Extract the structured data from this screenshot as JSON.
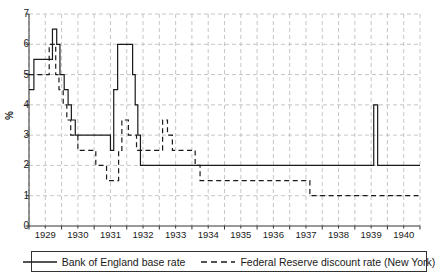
{
  "chart_data": {
    "type": "line",
    "title": "",
    "xlabel": "",
    "ylabel": "%",
    "xlim": [
      1929.0,
      1941.0
    ],
    "ylim": [
      0,
      7
    ],
    "yticks": [
      0,
      1,
      2,
      3,
      4,
      5,
      6,
      7
    ],
    "xticks": [
      1929,
      1930,
      1931,
      1932,
      1933,
      1934,
      1935,
      1936,
      1937,
      1938,
      1939,
      1940
    ],
    "grid": "dashed-both-axes",
    "legend_position": "below-axes",
    "series": [
      {
        "name": "Bank of England base rate",
        "style": "solid",
        "color": "#1a1a1a",
        "points": [
          [
            1929.0,
            4.5
          ],
          [
            1929.15,
            4.5
          ],
          [
            1929.15,
            5.5
          ],
          [
            1929.72,
            5.5
          ],
          [
            1929.72,
            6.5
          ],
          [
            1929.85,
            6.5
          ],
          [
            1929.85,
            6.0
          ],
          [
            1929.95,
            6.0
          ],
          [
            1929.95,
            5.0
          ],
          [
            1930.08,
            5.0
          ],
          [
            1930.08,
            4.5
          ],
          [
            1930.2,
            4.5
          ],
          [
            1930.2,
            4.0
          ],
          [
            1930.3,
            4.0
          ],
          [
            1930.3,
            3.5
          ],
          [
            1930.42,
            3.5
          ],
          [
            1930.42,
            3.0
          ],
          [
            1931.5,
            3.0
          ],
          [
            1931.5,
            2.5
          ],
          [
            1931.6,
            2.5
          ],
          [
            1931.6,
            4.5
          ],
          [
            1931.72,
            4.5
          ],
          [
            1931.72,
            6.0
          ],
          [
            1932.18,
            6.0
          ],
          [
            1932.18,
            5.0
          ],
          [
            1932.26,
            5.0
          ],
          [
            1932.26,
            4.0
          ],
          [
            1932.34,
            4.0
          ],
          [
            1932.34,
            3.0
          ],
          [
            1932.42,
            3.0
          ],
          [
            1932.42,
            2.0
          ],
          [
            1939.58,
            2.0
          ],
          [
            1939.58,
            4.0
          ],
          [
            1939.7,
            4.0
          ],
          [
            1939.7,
            2.0
          ],
          [
            1941.0,
            2.0
          ]
        ]
      },
      {
        "name": "Federal Reserve discount rate (New York)",
        "style": "dashed",
        "color": "#1a1a1a",
        "points": [
          [
            1929.0,
            5.0
          ],
          [
            1929.62,
            5.0
          ],
          [
            1929.62,
            6.0
          ],
          [
            1929.82,
            6.0
          ],
          [
            1929.82,
            5.0
          ],
          [
            1929.92,
            5.0
          ],
          [
            1929.92,
            4.5
          ],
          [
            1930.05,
            4.5
          ],
          [
            1930.05,
            4.0
          ],
          [
            1930.16,
            4.0
          ],
          [
            1930.16,
            3.5
          ],
          [
            1930.28,
            3.5
          ],
          [
            1930.28,
            3.0
          ],
          [
            1930.5,
            3.0
          ],
          [
            1930.5,
            2.5
          ],
          [
            1931.05,
            2.5
          ],
          [
            1931.05,
            2.0
          ],
          [
            1931.38,
            2.0
          ],
          [
            1931.38,
            1.5
          ],
          [
            1931.75,
            1.5
          ],
          [
            1931.75,
            2.5
          ],
          [
            1931.85,
            2.5
          ],
          [
            1931.85,
            3.5
          ],
          [
            1932.05,
            3.5
          ],
          [
            1932.05,
            3.0
          ],
          [
            1932.3,
            3.0
          ],
          [
            1932.3,
            2.5
          ],
          [
            1933.1,
            2.5
          ],
          [
            1933.1,
            3.5
          ],
          [
            1933.25,
            3.5
          ],
          [
            1933.25,
            3.0
          ],
          [
            1933.4,
            3.0
          ],
          [
            1933.4,
            2.5
          ],
          [
            1934.1,
            2.5
          ],
          [
            1934.1,
            2.0
          ],
          [
            1934.25,
            2.0
          ],
          [
            1934.25,
            1.5
          ],
          [
            1937.62,
            1.5
          ],
          [
            1937.62,
            1.0
          ],
          [
            1941.0,
            1.0
          ]
        ]
      }
    ]
  },
  "axes": {
    "y_title": "%",
    "y_tick_labels": [
      "0",
      "1",
      "2",
      "3",
      "4",
      "5",
      "6",
      "7"
    ],
    "x_tick_labels": [
      "1929",
      "1930",
      "1931",
      "1932",
      "1933",
      "1934",
      "1935",
      "1936",
      "1937",
      "1938",
      "1939",
      "1940"
    ]
  },
  "legend": {
    "entries": [
      {
        "label": "Bank of England base rate",
        "style": "solid"
      },
      {
        "label": "Federal Reserve discount rate (New York)",
        "style": "dashed"
      }
    ]
  },
  "colors": {
    "line": "#1a1a1a",
    "grid": "#b8b8b8",
    "axis": "#333333",
    "background": "#ffffff"
  }
}
